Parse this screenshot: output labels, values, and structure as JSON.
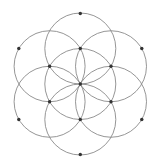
{
  "diagram": {
    "canvas": {
      "width": 164,
      "height": 162,
      "background": "#ffffff"
    },
    "center": {
      "x": 80.3,
      "y": 84
    },
    "circle_radius": 35.5,
    "colors": {
      "stroke": "#8a8a8a",
      "node": "#333333"
    },
    "circles": [
      {
        "id": "center",
        "cx": 80.3,
        "cy": 84
      },
      {
        "id": "top",
        "cx": 80.3,
        "cy": 48.5
      },
      {
        "id": "upper-right",
        "cx": 111.0,
        "cy": 66.25
      },
      {
        "id": "lower-right",
        "cx": 111.0,
        "cy": 101.75
      },
      {
        "id": "bottom",
        "cx": 80.3,
        "cy": 119.5
      },
      {
        "id": "lower-left",
        "cx": 49.6,
        "cy": 101.75
      },
      {
        "id": "upper-left",
        "cx": 49.6,
        "cy": 66.25
      }
    ],
    "nodes": [
      {
        "id": "outer-top",
        "x": 80.3,
        "y": 13.5
      },
      {
        "id": "outer-upper-right",
        "x": 141.8,
        "y": 48.5
      },
      {
        "id": "outer-lower-right",
        "x": 141.8,
        "y": 119.5
      },
      {
        "id": "outer-bottom",
        "x": 80.3,
        "y": 154.5
      },
      {
        "id": "outer-lower-left",
        "x": 18.8,
        "y": 119.5
      },
      {
        "id": "outer-upper-left",
        "x": 18.8,
        "y": 48.5
      },
      {
        "id": "inner-top",
        "x": 80.3,
        "y": 48.5
      },
      {
        "id": "inner-upper-right",
        "x": 111.0,
        "y": 66.25
      },
      {
        "id": "inner-lower-right",
        "x": 111.0,
        "y": 101.75
      },
      {
        "id": "inner-bottom",
        "x": 80.3,
        "y": 119.5
      },
      {
        "id": "inner-lower-left",
        "x": 49.6,
        "y": 101.75
      },
      {
        "id": "inner-upper-left",
        "x": 49.6,
        "y": 66.25
      },
      {
        "id": "center",
        "x": 80.3,
        "y": 84
      }
    ],
    "node_radius": 1.7
  }
}
